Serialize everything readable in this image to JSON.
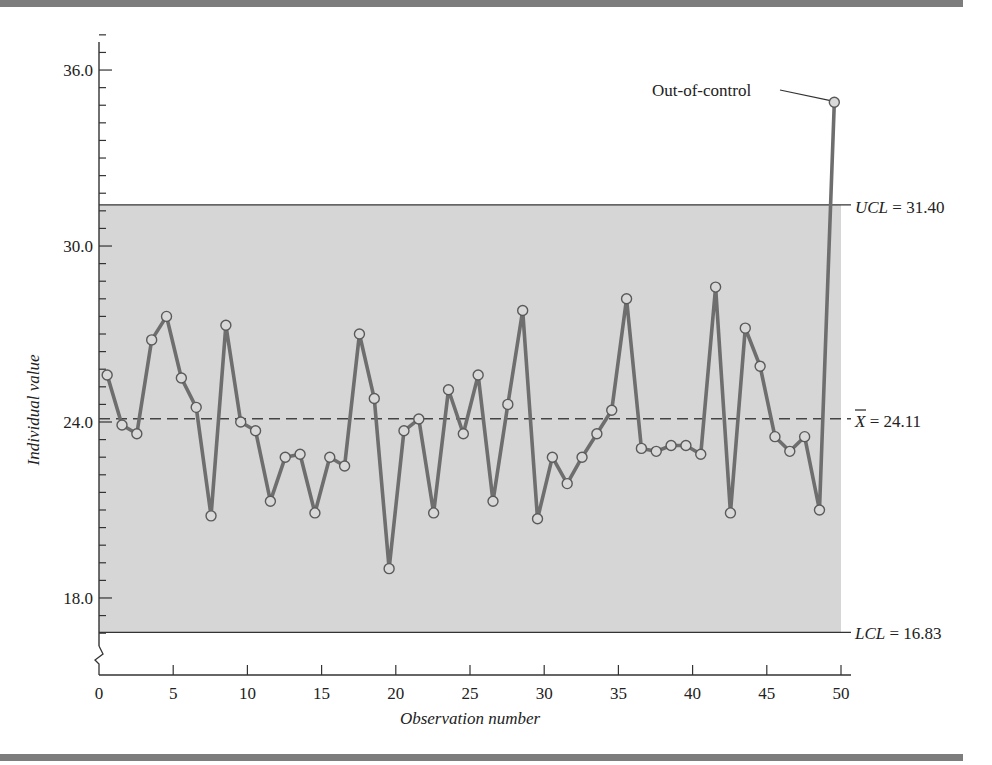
{
  "chart_data": {
    "type": "line",
    "title": "",
    "xlabel": "Observation number",
    "ylabel": "Individual value",
    "xlim": [
      0,
      50
    ],
    "ylim": [
      16.2,
      37.8
    ],
    "x_ticks": [
      0,
      5,
      10,
      15,
      20,
      25,
      30,
      35,
      40,
      45,
      50
    ],
    "y_ticks": [
      18.0,
      24.0,
      30.0
    ],
    "y_tick_labels": [
      "18.0",
      "24.0",
      "30.0",
      "36.0"
    ],
    "y_major_ticks": [
      18.0,
      24.0,
      30.0,
      36.0
    ],
    "y_minor_step": 0.6,
    "grid": false,
    "legend": null,
    "control_limits": {
      "ucl": 31.4,
      "center": 24.11,
      "lcl": 16.83,
      "ucl_label": "UCL = 31.40",
      "center_label": "X̄ = 24.11",
      "lcl_label": "LCL = 16.83"
    },
    "annotations": [
      {
        "text": "Out-of-control",
        "point_index": 50
      }
    ],
    "x": [
      1,
      2,
      3,
      4,
      5,
      6,
      7,
      8,
      9,
      10,
      11,
      12,
      13,
      14,
      15,
      16,
      17,
      18,
      19,
      20,
      21,
      22,
      23,
      24,
      25,
      26,
      27,
      28,
      29,
      30,
      31,
      32,
      33,
      34,
      35,
      36,
      37,
      38,
      39,
      40,
      41,
      42,
      43,
      44,
      45,
      46,
      47,
      48,
      49,
      50
    ],
    "series": [
      {
        "name": "Individual value",
        "values": [
          25.6,
          23.9,
          23.6,
          26.8,
          27.6,
          25.5,
          24.5,
          20.8,
          27.3,
          24.0,
          23.7,
          21.3,
          22.8,
          22.9,
          20.9,
          22.8,
          22.5,
          27.0,
          24.8,
          19.0,
          23.7,
          24.1,
          20.9,
          25.1,
          23.6,
          25.6,
          21.3,
          24.6,
          27.8,
          20.7,
          22.8,
          21.9,
          22.8,
          23.6,
          24.4,
          28.2,
          23.1,
          23.0,
          23.2,
          23.2,
          22.9,
          28.6,
          20.9,
          27.2,
          25.9,
          23.5,
          23.0,
          23.5,
          21.0,
          34.9
        ]
      }
    ]
  },
  "labels": {
    "ylabel": "Individual value",
    "xlabel": "Observation number",
    "ucl": "= 31.40",
    "ucl_name": "UCL",
    "center": "= 24.11",
    "center_name": "X",
    "lcl": "= 16.83",
    "lcl_name": "LCL",
    "out_of_control": "Out-of-control"
  },
  "colors": {
    "shade": "#d6d6d6",
    "line": "#6e6e6e",
    "marker_fill": "#d9d9d9",
    "axis": "#333333",
    "frame_bar": "#7d7d7d"
  }
}
